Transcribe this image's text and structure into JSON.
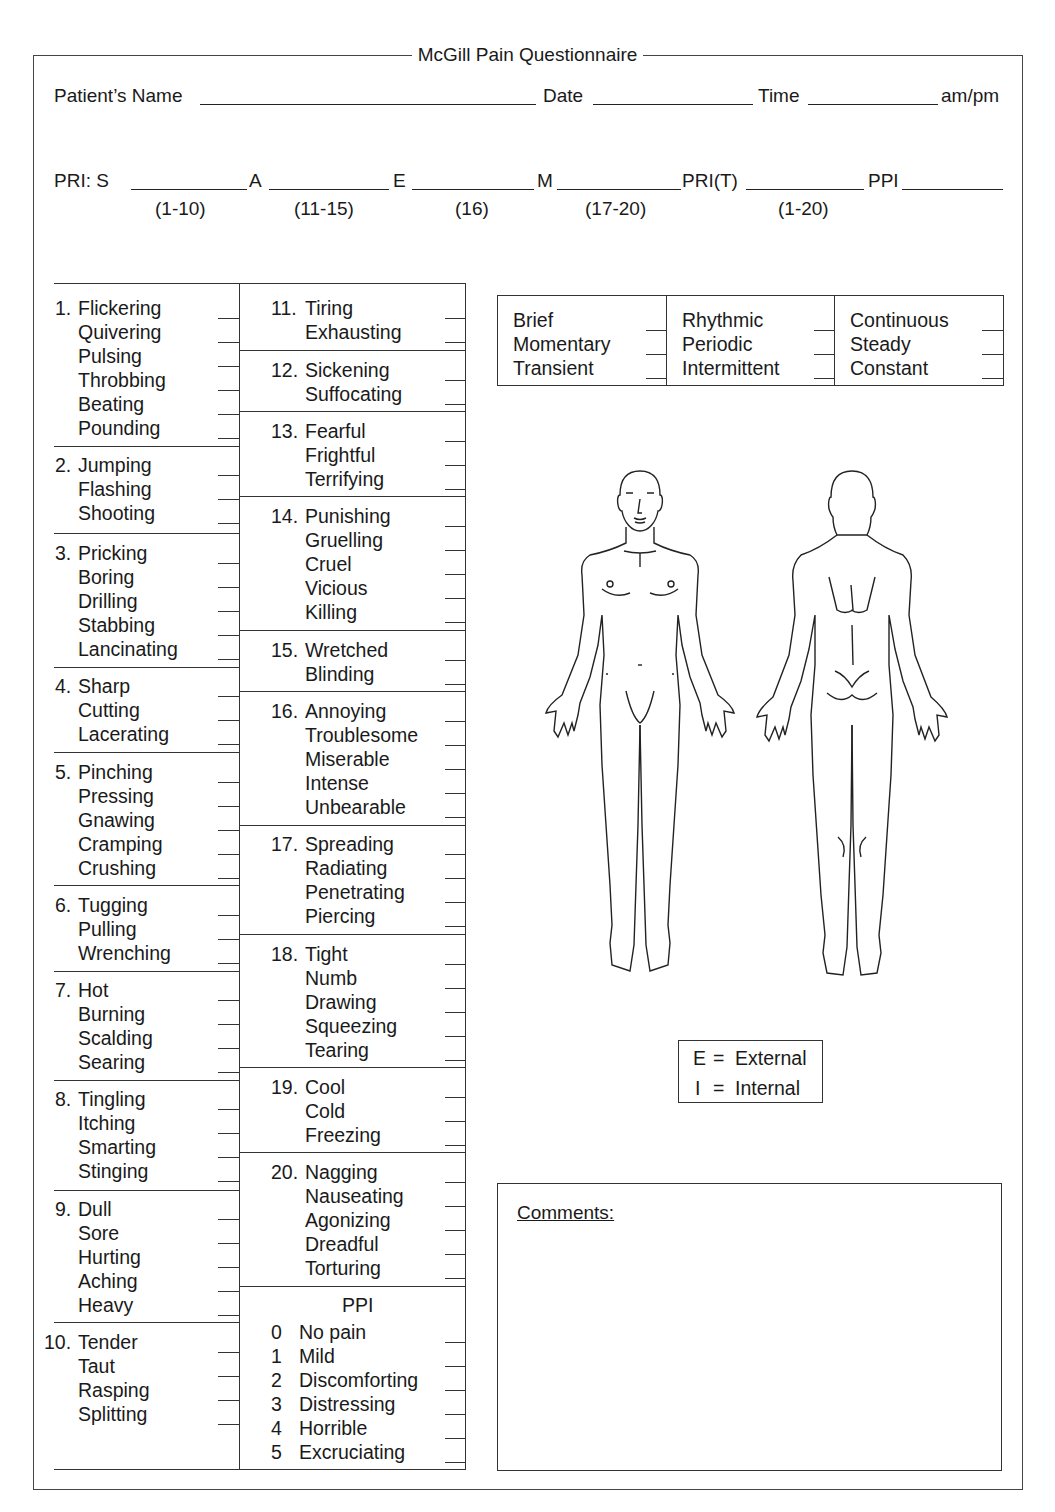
{
  "form": {
    "title": "McGill Pain Questionnaire",
    "header_fields": [
      {
        "label": "Patient’s Name",
        "value": ""
      },
      {
        "label": "Date",
        "value": ""
      },
      {
        "label": "Time",
        "value": "",
        "suffix": "am/pm"
      }
    ],
    "pri_fields": [
      {
        "label": "PRI:  S",
        "range": "(1-10)",
        "value": ""
      },
      {
        "label": "A",
        "range": "(11-15)",
        "value": ""
      },
      {
        "label": "E",
        "range": "(16)",
        "value": ""
      },
      {
        "label": "M",
        "range": "(17-20)",
        "value": ""
      },
      {
        "label": "PRI(T)",
        "range": "(1-20)",
        "value": ""
      },
      {
        "label": "PPI",
        "range": "",
        "value": ""
      }
    ]
  },
  "descriptors_left": [
    {
      "num": "1.",
      "words": [
        "Flickering",
        "Quivering",
        "Pulsing",
        "Throbbing",
        "Beating",
        "Pounding"
      ]
    },
    {
      "num": "2.",
      "words": [
        "Jumping",
        "Flashing",
        "Shooting"
      ]
    },
    {
      "num": "3.",
      "words": [
        "Pricking",
        "Boring",
        "Drilling",
        "Stabbing",
        "Lancinating"
      ]
    },
    {
      "num": "4.",
      "words": [
        "Sharp",
        "Cutting",
        "Lacerating"
      ]
    },
    {
      "num": "5.",
      "words": [
        "Pinching",
        "Pressing",
        "Gnawing",
        "Cramping",
        "Crushing"
      ]
    },
    {
      "num": "6.",
      "words": [
        "Tugging",
        "Pulling",
        "Wrenching"
      ]
    },
    {
      "num": "7.",
      "words": [
        "Hot",
        "Burning",
        "Scalding",
        "Searing"
      ]
    },
    {
      "num": "8.",
      "words": [
        "Tingling",
        "Itching",
        "Smarting",
        "Stinging"
      ]
    },
    {
      "num": "9.",
      "words": [
        "Dull",
        "Sore",
        "Hurting",
        "Aching",
        "Heavy"
      ]
    },
    {
      "num": "10.",
      "words": [
        "Tender",
        "Taut",
        "Rasping",
        "Splitting"
      ]
    }
  ],
  "descriptors_right": [
    {
      "num": "11.",
      "words": [
        "Tiring",
        "Exhausting"
      ]
    },
    {
      "num": "12.",
      "words": [
        "Sickening",
        "Suffocating"
      ]
    },
    {
      "num": "13.",
      "words": [
        "Fearful",
        "Frightful",
        "Terrifying"
      ]
    },
    {
      "num": "14.",
      "words": [
        "Punishing",
        "Gruelling",
        "Cruel",
        "Vicious",
        "Killing"
      ]
    },
    {
      "num": "15.",
      "words": [
        "Wretched",
        "Blinding"
      ]
    },
    {
      "num": "16.",
      "words": [
        "Annoying",
        "Troublesome",
        "Miserable",
        "Intense",
        "Unbearable"
      ]
    },
    {
      "num": "17.",
      "words": [
        "Spreading",
        "Radiating",
        "Penetrating",
        "Piercing"
      ]
    },
    {
      "num": "18.",
      "words": [
        "Tight",
        "Numb",
        "Drawing",
        "Squeezing",
        "Tearing"
      ]
    },
    {
      "num": "19.",
      "words": [
        "Cool",
        "Cold",
        "Freezing"
      ]
    },
    {
      "num": "20.",
      "words": [
        "Nagging",
        "Nauseating",
        "Agonizing",
        "Dreadful",
        "Torturing"
      ]
    }
  ],
  "ppi": {
    "title": "PPI",
    "items": [
      {
        "num": "0",
        "label": "No pain"
      },
      {
        "num": "1",
        "label": "Mild"
      },
      {
        "num": "2",
        "label": "Discomforting"
      },
      {
        "num": "3",
        "label": "Distressing"
      },
      {
        "num": "4",
        "label": "Horrible"
      },
      {
        "num": "5",
        "label": "Excruciating"
      }
    ]
  },
  "temporal": [
    [
      "Brief",
      "Momentary",
      "Transient"
    ],
    [
      "Rhythmic",
      "Periodic",
      "Intermittent"
    ],
    [
      "Continuous",
      "Steady",
      "Constant"
    ]
  ],
  "body_diagram": {
    "views": [
      "front-body-figure",
      "back-body-figure"
    ]
  },
  "legend": {
    "items": [
      {
        "key": "E",
        "eq": "=",
        "label": "External"
      },
      {
        "key": "I",
        "eq": "=",
        "label": "Internal"
      }
    ]
  },
  "comments": {
    "label": "Comments:",
    "value": ""
  }
}
